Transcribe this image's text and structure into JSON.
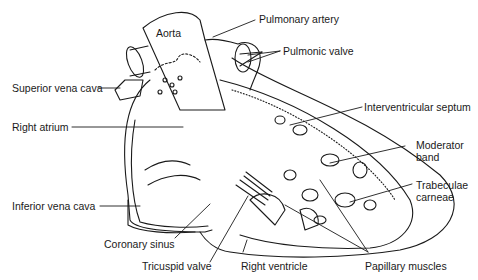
{
  "diagram": {
    "labels": {
      "aorta": "Aorta",
      "pulmonary_artery": "Pulmonary artery",
      "pulmonic_valve": "Pulmonic valve",
      "superior_vena_cava": "Superior vena cava",
      "right_atrium": "Right atrium",
      "interventricular_septum": "Interventricular septum",
      "moderator_band_1": "Moderator",
      "moderator_band_2": "band",
      "trabeculae_carneae_1": "Trabeculae",
      "trabeculae_carneae_2": "carneae",
      "inferior_vena_cava": "Inferior vena cava",
      "coronary_sinus": "Coronary sinus",
      "tricuspid_valve": "Tricuspid valve",
      "right_ventricle": "Right ventricle",
      "papillary_muscles": "Papillary muscles"
    },
    "colors": {
      "line": "#1a1a1a",
      "background": "#ffffff"
    }
  }
}
